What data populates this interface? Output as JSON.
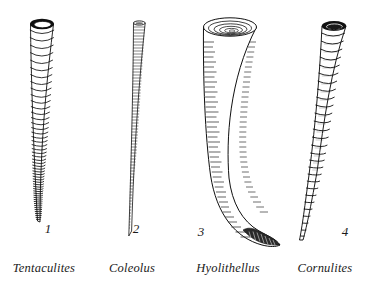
{
  "plate": {
    "title": "Fossil tube-dwelling organisms comparative plate",
    "background_color": "#ffffff",
    "ink_color": "#101010",
    "width": 375,
    "height": 282
  },
  "specimens": [
    {
      "number": "1",
      "genus": "Tentaculites",
      "icon": "annulated-conical-tube-icon",
      "description": "Long slender cone with strong evenly spaced ring annulations, dark open aperture at top, tapering to a fine point",
      "num_x": 48,
      "num_y": 233,
      "label_x": 44,
      "label_y": 272,
      "apex_x": 42,
      "apex_y": 22,
      "tip_x": 31,
      "tip_y": 222,
      "top_width": 25,
      "rings": 46
    },
    {
      "number": "2",
      "genus": "Coleolus",
      "icon": "slender-striated-tube-icon",
      "description": "Very slender nearly straight tube with fine transverse striations, narrowing to a delicate curved point",
      "num_x": 136,
      "num_y": 233,
      "label_x": 132,
      "label_y": 272,
      "apex_x": 139,
      "apex_y": 22,
      "tip_x": 129,
      "tip_y": 236,
      "top_width": 13,
      "rings": 70
    },
    {
      "number": "3",
      "genus": "Hyolithellus",
      "icon": "broad-curved-horn-icon",
      "description": "Broad stout cone with concentric rings at the wide aperture, dense horizontal hatching, strongly hooked and shaded at the lower end",
      "num_x": 201,
      "num_y": 236,
      "label_x": 200,
      "label_y": 272,
      "apex_x": 230,
      "apex_y": 22,
      "tip_x": 279,
      "tip_y": 246,
      "top_width": 55,
      "rings": 40
    },
    {
      "number": "4",
      "genus": "Cornulites",
      "icon": "bulbous-annulated-tube-icon",
      "description": "Tapering tube with bulging trumpet-like annulations and dark elliptical aperture, curving to the left toward the pointed tip",
      "num_x": 345,
      "num_y": 236,
      "label_x": 312,
      "label_y": 272,
      "apex_x": 334,
      "apex_y": 22,
      "tip_x": 300,
      "tip_y": 240,
      "top_width": 24,
      "rings": 24
    }
  ]
}
